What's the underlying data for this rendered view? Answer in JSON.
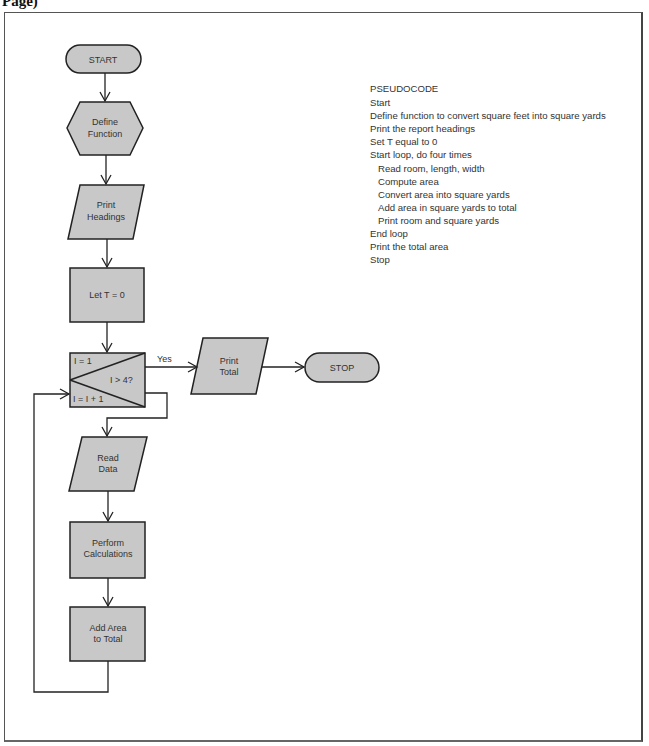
{
  "page_caption": "Page)",
  "flowchart": {
    "start": "START",
    "define_function": [
      "Define",
      "Function"
    ],
    "print_headings": [
      "Print",
      "Headings"
    ],
    "let_t": "Let T = 0",
    "loop": {
      "init": "I = 1",
      "condition": "I > 4?",
      "increment": "I = I + 1",
      "yes_label": "Yes"
    },
    "print_total": [
      "Print",
      "Total"
    ],
    "stop": "STOP",
    "read_data": [
      "Read",
      "Data"
    ],
    "perform_calculations": [
      "Perform",
      "Calculations"
    ],
    "add_area": [
      "Add Area",
      "to Total"
    ]
  },
  "pseudocode": {
    "title": "PSEUDOCODE",
    "lines": [
      {
        "text": "Start",
        "indent": 0
      },
      {
        "text": "Define function to convert square feet into square yards",
        "indent": 0
      },
      {
        "text": "Print the report headings",
        "indent": 0
      },
      {
        "text": "Set T equal to 0",
        "indent": 0
      },
      {
        "text": "Start loop, do four times",
        "indent": 0
      },
      {
        "text": "Read room, length, width",
        "indent": 1
      },
      {
        "text": "Compute area",
        "indent": 1
      },
      {
        "text": "Convert area into square yards",
        "indent": 1
      },
      {
        "text": "Add area in square yards to total",
        "indent": 1
      },
      {
        "text": "Print room and square yards",
        "indent": 1
      },
      {
        "text": "End loop",
        "indent": 0
      },
      {
        "text": "Print the total area",
        "indent": 0
      },
      {
        "text": "Stop",
        "indent": 0
      }
    ]
  },
  "colors": {
    "shape_fill": "#c8c8c8",
    "stroke": "#222222",
    "text": "#333333"
  }
}
